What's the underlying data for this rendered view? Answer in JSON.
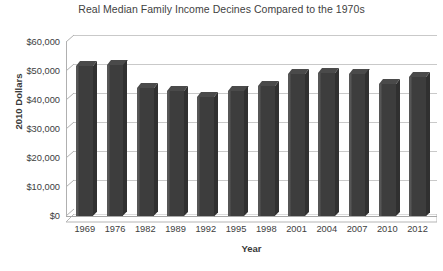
{
  "chart_data": {
    "type": "bar",
    "title": "Real Median Family Income Decines Compared to the 1970s",
    "xlabel": "Year",
    "ylabel": "2010 Dollars",
    "categories": [
      "1969",
      "1976",
      "1982",
      "1989",
      "1992",
      "1995",
      "1998",
      "2001",
      "2004",
      "2007",
      "2010",
      "2012"
    ],
    "values": [
      51600,
      51900,
      44000,
      43100,
      41200,
      43100,
      44700,
      49000,
      49300,
      49100,
      45500,
      48000
    ],
    "ylim": [
      0,
      60000
    ],
    "ytick_values": [
      0,
      10000,
      20000,
      30000,
      40000,
      50000,
      60000
    ],
    "ytick_labels": [
      "$0",
      "$10,000",
      "$20,000",
      "$30,000",
      "$40,000",
      "$50,000",
      "$60,000"
    ],
    "grid": true,
    "legend": false,
    "bar_color": "#404040",
    "gridline_color": "#c9c9c9",
    "background_color": "#ffffff",
    "style": "3d-column"
  }
}
